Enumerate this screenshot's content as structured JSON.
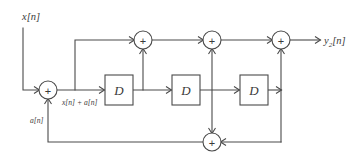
{
  "diagram": {
    "type": "signal-flow-block-diagram",
    "title": "",
    "signals": {
      "input": "x[n]",
      "output_base": "y",
      "output_subscript": "2",
      "output_suffix": "[n]",
      "output_full": "y2[n]",
      "adder_out": "x[n] + a[n]",
      "feedback": "a[n]"
    },
    "blocks": [
      {
        "id": "delay-1",
        "label": "D",
        "x": 105,
        "y": 75,
        "w": 28,
        "h": 30
      },
      {
        "id": "delay-2",
        "label": "D",
        "x": 172,
        "y": 75,
        "w": 28,
        "h": 30
      },
      {
        "id": "delay-3",
        "label": "D",
        "x": 240,
        "y": 75,
        "w": 28,
        "h": 30
      }
    ],
    "adders": [
      {
        "id": "adder-input",
        "label": "+",
        "cx": 48,
        "cy": 90,
        "r": 9
      },
      {
        "id": "adder-top-1",
        "label": "+",
        "cx": 143,
        "cy": 40,
        "r": 9
      },
      {
        "id": "adder-top-2",
        "label": "+",
        "cx": 212,
        "cy": 40,
        "r": 9
      },
      {
        "id": "adder-top-3",
        "label": "+",
        "cx": 281,
        "cy": 40,
        "r": 9
      },
      {
        "id": "adder-bottom",
        "label": "+",
        "cx": 212,
        "cy": 142,
        "r": 9
      }
    ],
    "labels": {
      "input_x": 22,
      "input_y": 20,
      "output_x": 324,
      "output_y": 44,
      "adder_out_x": 62,
      "adder_out_y": 105,
      "feedback_x": 30,
      "feedback_y": 123
    }
  }
}
